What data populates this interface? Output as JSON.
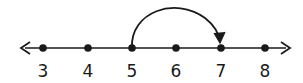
{
  "diagram": {
    "type": "number-line",
    "ticks": [
      {
        "label": "3",
        "x": 43
      },
      {
        "label": "4",
        "x": 88
      },
      {
        "label": "5",
        "x": 132
      },
      {
        "label": "6",
        "x": 176
      },
      {
        "label": "7",
        "x": 221
      },
      {
        "label": "8",
        "x": 265
      }
    ],
    "jump": {
      "from": "5",
      "to": "7"
    },
    "arrows": {
      "left": true,
      "right": true
    },
    "color": "#1a1a1a"
  }
}
